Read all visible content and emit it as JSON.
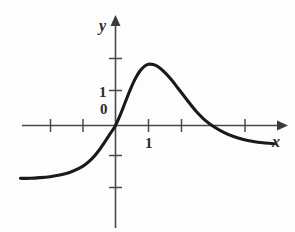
{
  "figure": {
    "kind": "cartesian-plot",
    "background_color": "#fdfdfd",
    "curve_color": "#1a1a1a",
    "axis_color": "#4a4a4a",
    "labels": {
      "y_axis": "y",
      "x_axis": "x",
      "y_tick_1": "1",
      "origin": "0",
      "x_tick_1": "1"
    }
  },
  "chart_data": {
    "type": "line",
    "title": "",
    "xlabel": "x",
    "ylabel": "y",
    "xlim": [
      -2.9,
      5.0
    ],
    "ylim": [
      -3.5,
      3.3
    ],
    "grid": false,
    "legend": null,
    "axis_ticks": {
      "x_values": [
        -2,
        -1,
        0,
        1,
        2,
        3,
        4
      ],
      "x_labeled": [
        "1"
      ],
      "y_values": [
        -2,
        -1,
        0,
        1,
        2
      ],
      "y_labeled": [
        "0",
        "1"
      ]
    },
    "annotations": [
      {
        "text": "0",
        "x": 0,
        "y": 0
      },
      {
        "text": "1",
        "x": 0,
        "y": 1
      },
      {
        "text": "1",
        "x": 1,
        "y": 0
      }
    ],
    "series": [
      {
        "name": "curve",
        "x": [
          -2.9,
          -2.6,
          -2.3,
          -2.0,
          -1.7,
          -1.4,
          -1.1,
          -0.9,
          -0.7,
          -0.5,
          -0.35,
          -0.2,
          -0.1,
          0.0,
          0.1,
          0.2,
          0.3,
          0.45,
          0.6,
          0.75,
          0.9,
          1.0,
          1.15,
          1.3,
          1.5,
          1.7,
          1.9,
          2.1,
          2.3,
          2.5,
          2.7,
          3.0,
          3.3,
          3.6,
          3.9,
          4.2,
          4.5,
          4.85
        ],
        "y": [
          -1.62,
          -1.62,
          -1.6,
          -1.57,
          -1.52,
          -1.44,
          -1.31,
          -1.18,
          -1.0,
          -0.76,
          -0.54,
          -0.31,
          -0.16,
          0.0,
          0.22,
          0.46,
          0.72,
          1.1,
          1.43,
          1.68,
          1.83,
          1.88,
          1.87,
          1.8,
          1.63,
          1.41,
          1.15,
          0.89,
          0.63,
          0.39,
          0.19,
          -0.04,
          -0.21,
          -0.34,
          -0.43,
          -0.49,
          -0.53,
          -0.56
        ]
      }
    ]
  }
}
